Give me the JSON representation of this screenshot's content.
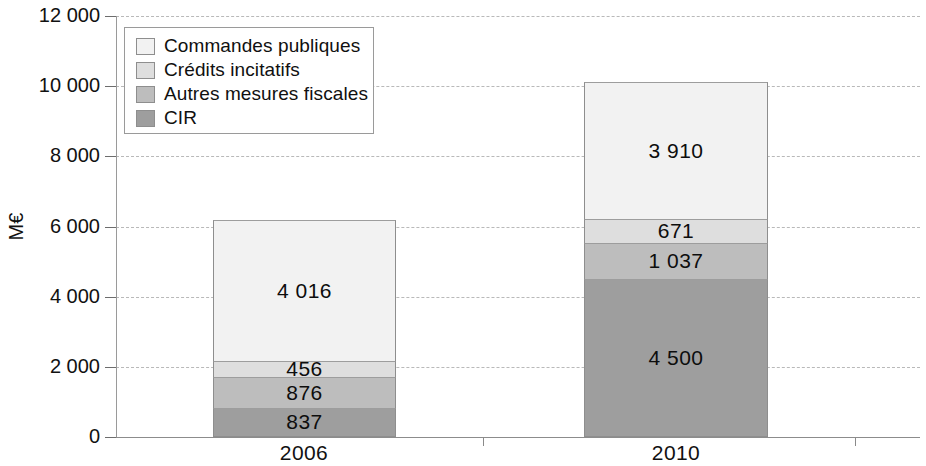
{
  "chart_data": {
    "type": "bar",
    "subtype": "stacked-vertical",
    "title": "",
    "xlabel": "",
    "ylabel": "M€",
    "categories": [
      "2006",
      "2010"
    ],
    "ylim": [
      0,
      12000
    ],
    "ytick_labels": [
      "0",
      "2 000",
      "4 000",
      "6 000",
      "8 000",
      "10 000",
      "12 000"
    ],
    "ytick_values": [
      0,
      2000,
      4000,
      6000,
      8000,
      10000,
      12000
    ],
    "grid": true,
    "grid_style": "dashed-horizontal",
    "legend_position": "top-left-inside",
    "stack_order_bottom_to_top": [
      "CIR",
      "Autres mesures fiscales",
      "Crédits incitatifs",
      "Commandes publiques"
    ],
    "series": [
      {
        "name": "Commandes publiques",
        "color": "#f2f2f2",
        "values": [
          4016,
          3910
        ],
        "labels": [
          "4 016",
          "3 910"
        ]
      },
      {
        "name": "Crédits incitatifs",
        "color": "#dedede",
        "values": [
          456,
          671
        ],
        "labels": [
          "456",
          "671"
        ]
      },
      {
        "name": "Autres mesures fiscales",
        "color": "#bdbdbd",
        "values": [
          876,
          1037
        ],
        "labels": [
          "876",
          "1 037"
        ]
      },
      {
        "name": "CIR",
        "color": "#9e9e9e",
        "values": [
          837,
          4500
        ],
        "labels": [
          "837",
          "4 500"
        ]
      }
    ],
    "totals": [
      6185,
      10118
    ]
  },
  "legend": {
    "items": [
      {
        "label": "Commandes publiques",
        "swatch": "#f2f2f2"
      },
      {
        "label": "Crédits incitatifs",
        "swatch": "#dedede"
      },
      {
        "label": "Autres mesures fiscales",
        "swatch": "#bdbdbd"
      },
      {
        "label": "CIR",
        "swatch": "#9e9e9e"
      }
    ]
  },
  "axis": {
    "y_title": "M€",
    "y_ticks": [
      {
        "label": "12 000",
        "value": 12000
      },
      {
        "label": "10 000",
        "value": 10000
      },
      {
        "label": "8 000",
        "value": 8000
      },
      {
        "label": "6 000",
        "value": 6000
      },
      {
        "label": "4 000",
        "value": 4000
      },
      {
        "label": "2 000",
        "value": 2000
      },
      {
        "label": "0",
        "value": 0
      }
    ],
    "x_ticks": [
      {
        "label": "2006"
      },
      {
        "label": "2010"
      }
    ]
  },
  "bars": [
    {
      "category": "2006",
      "total": 6185,
      "segments": [
        {
          "name": "Commandes publiques",
          "value": 4016,
          "label": "4 016",
          "color": "#f2f2f2"
        },
        {
          "name": "Crédits incitatifs",
          "value": 456,
          "label": "456",
          "color": "#dedede"
        },
        {
          "name": "Autres mesures fiscales",
          "value": 876,
          "label": "876",
          "color": "#bdbdbd"
        },
        {
          "name": "CIR",
          "value": 837,
          "label": "837",
          "color": "#9e9e9e"
        }
      ]
    },
    {
      "category": "2010",
      "total": 10118,
      "segments": [
        {
          "name": "Commandes publiques",
          "value": 3910,
          "label": "3 910",
          "color": "#f2f2f2"
        },
        {
          "name": "Crédits incitatifs",
          "value": 671,
          "label": "671",
          "color": "#dedede"
        },
        {
          "name": "Autres mesures fiscales",
          "value": 1037,
          "label": "1 037",
          "color": "#bdbdbd"
        },
        {
          "name": "CIR",
          "value": 4500,
          "label": "4 500",
          "color": "#9e9e9e"
        }
      ]
    }
  ]
}
